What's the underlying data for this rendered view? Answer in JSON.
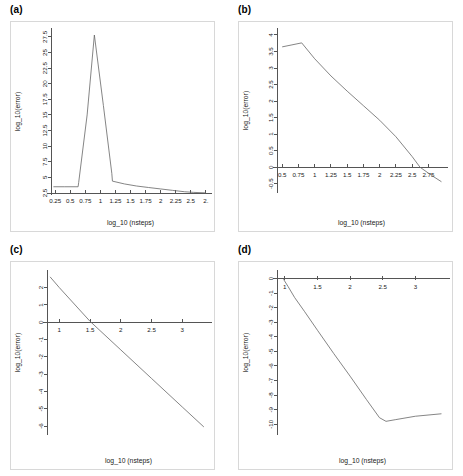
{
  "figure": {
    "panels": [
      {
        "label": "(a)",
        "xlabel": "log_10 (nsteps)",
        "ylabel": "log_10(error)"
      },
      {
        "label": "(b)",
        "xlabel": "log_10 (nsteps)",
        "ylabel": "log_10(error)"
      },
      {
        "label": "(c)",
        "xlabel": "log_10 (nsteps)",
        "ylabel": "log_10(error)"
      },
      {
        "label": "(d)",
        "xlabel": "log_10 (nsteps)",
        "ylabel": "log_10(error)"
      }
    ]
  },
  "chart_data": [
    {
      "id": "panel-a",
      "type": "line",
      "title": "(a)",
      "xlabel": "log_10 (nsteps)",
      "ylabel": "log_10(error)",
      "xlim": [
        0.18,
        2.82
      ],
      "ylim": [
        2.5,
        28.6
      ],
      "xticks": [
        0.25,
        0.5,
        0.75,
        1,
        1.25,
        1.5,
        1.75,
        2,
        2.25,
        2.5,
        2.75
      ],
      "xticklabels": [
        "0.25",
        "0.5",
        "0.75",
        "1",
        "1.25",
        "1.5",
        "1.75",
        "2",
        "2.25",
        "2.5",
        "2."
      ],
      "yticks": [
        2.5,
        5,
        7.5,
        10,
        12.5,
        15,
        17.5,
        20,
        22.5,
        25,
        27.5
      ],
      "yticklabels": [
        "2.5",
        "5",
        "7.5",
        "10",
        "12.5",
        "15",
        "17.5",
        "20",
        "22.5",
        "25",
        "27.5"
      ],
      "grid": false,
      "legend": null,
      "series": [
        {
          "name": "error",
          "x": [
            0.22,
            0.4,
            0.63,
            0.64,
            0.78,
            0.9,
            1.05,
            1.19,
            1.2,
            1.4,
            1.6,
            1.8,
            2.0,
            2.2,
            2.4,
            2.55,
            2.75
          ],
          "y": [
            3.5,
            3.5,
            3.5,
            4.2,
            15.0,
            27.8,
            16.5,
            5.6,
            4.4,
            3.95,
            3.62,
            3.38,
            3.15,
            2.92,
            2.7,
            2.6,
            2.52
          ]
        }
      ]
    },
    {
      "id": "panel-b",
      "type": "line",
      "title": "(b)",
      "xlabel": "log_10 (nsteps)",
      "ylabel": "log_10(error)",
      "xlim": [
        0.42,
        3.02
      ],
      "ylim": [
        -0.72,
        4.15
      ],
      "xticks": [
        0.5,
        0.75,
        1,
        1.25,
        1.5,
        1.75,
        2,
        2.25,
        2.5,
        2.75
      ],
      "xticklabels": [
        "0.5",
        "0.75",
        "1",
        "1.25",
        "1.5",
        "1.75",
        "2",
        "2.25",
        "2.5",
        "2.75"
      ],
      "yticks": [
        -0.5,
        0,
        0.5,
        1,
        1.5,
        2,
        2.5,
        3,
        3.5,
        4
      ],
      "yticklabels": [
        "-0.5",
        "0",
        "0.5",
        "1",
        "1.5",
        "2",
        "2.5",
        "3",
        "3.5",
        "4"
      ],
      "grid": false,
      "legend": null,
      "series": [
        {
          "name": "error",
          "x": [
            0.5,
            0.65,
            0.8,
            1.0,
            1.25,
            1.5,
            1.75,
            2.0,
            2.25,
            2.5,
            2.62,
            2.8,
            2.95
          ],
          "y": [
            3.64,
            3.7,
            3.76,
            3.28,
            2.76,
            2.3,
            1.86,
            1.42,
            0.92,
            0.32,
            0.0,
            -0.25,
            -0.44
          ]
        }
      ]
    },
    {
      "id": "panel-c",
      "type": "line",
      "title": "(c)",
      "xlabel": "log_10 (nsteps)",
      "ylabel": "log_10(error)",
      "xlim": [
        0.8,
        3.45
      ],
      "ylim": [
        -6.4,
        2.9
      ],
      "xticks": [
        1,
        1.5,
        2,
        2.5,
        3
      ],
      "xticklabels": [
        "1",
        "1.5",
        "2",
        "2.5",
        "3"
      ],
      "yticks": [
        -6,
        -5,
        -4,
        -3,
        -2,
        -1,
        0,
        1,
        2
      ],
      "yticklabels": [
        "-6",
        "-5",
        "-4",
        "-3",
        "-2",
        "-1",
        "0",
        "1",
        "2"
      ],
      "grid": false,
      "legend": null,
      "series": [
        {
          "name": "error",
          "x": [
            0.85,
            1.0,
            1.5,
            2.0,
            2.5,
            3.0,
            3.35
          ],
          "y": [
            2.62,
            2.0,
            0.05,
            -1.6,
            -3.25,
            -4.9,
            -6.05
          ]
        }
      ]
    },
    {
      "id": "panel-d",
      "type": "line",
      "title": "(d)",
      "xlabel": "log_10 (nsteps)",
      "ylabel": "log_10(error)",
      "xlim": [
        0.88,
        3.5
      ],
      "ylim": [
        -10.6,
        0.45
      ],
      "xticks": [
        1,
        1.5,
        2,
        2.5,
        3
      ],
      "xticklabels": [
        "1",
        "1.5",
        "2",
        "2.5",
        "3"
      ],
      "yticks": [
        -10,
        -9,
        -8,
        -7,
        -6,
        -5,
        -4,
        -3,
        -2,
        -1,
        0
      ],
      "yticklabels": [
        "-10",
        "-9",
        "-8",
        "-7",
        "-6",
        "-5",
        "-4",
        "-3",
        "-2",
        "-1",
        "0"
      ],
      "grid": false,
      "legend": null,
      "series": [
        {
          "name": "error",
          "x": [
            0.98,
            1.05,
            1.15,
            1.3,
            1.5,
            1.75,
            2.0,
            2.25,
            2.45,
            2.55,
            2.7,
            3.0,
            3.4
          ],
          "y": [
            -0.05,
            -0.55,
            -1.3,
            -2.25,
            -3.55,
            -5.15,
            -6.7,
            -8.3,
            -9.55,
            -9.8,
            -9.68,
            -9.45,
            -9.28
          ]
        }
      ]
    }
  ]
}
